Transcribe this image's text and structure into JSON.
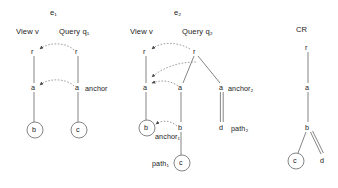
{
  "figure": {
    "panels": [
      {
        "id": "e1",
        "title": "e₁",
        "columns": [
          {
            "heading": "View v"
          },
          {
            "heading": "Query q₁"
          }
        ],
        "nodes": [
          {
            "name": "view-root",
            "label": "r",
            "circled": false,
            "x": 34,
            "y": 52
          },
          {
            "name": "view-a",
            "label": "a",
            "circled": false,
            "x": 34,
            "y": 88
          },
          {
            "name": "view-b",
            "label": "b",
            "circled": true,
            "x": 35,
            "y": 130
          },
          {
            "name": "query-root",
            "label": "r",
            "circled": false,
            "x": 78,
            "y": 52
          },
          {
            "name": "query-a",
            "label": "a",
            "circled": false,
            "x": 78,
            "y": 88
          },
          {
            "name": "query-c",
            "label": "c",
            "circled": true,
            "x": 79,
            "y": 130
          }
        ],
        "annotations": [
          {
            "name": "anchor-label",
            "text": "anchor",
            "x": 85,
            "y": 88
          }
        ]
      },
      {
        "id": "e2",
        "title": "e₂",
        "columns": [
          {
            "heading": "View v"
          },
          {
            "heading": "Query q₂"
          }
        ],
        "nodes": [
          {
            "name": "view-root",
            "label": "r",
            "circled": false,
            "x": 146,
            "y": 52
          },
          {
            "name": "view-a",
            "label": "a",
            "circled": false,
            "x": 146,
            "y": 88
          },
          {
            "name": "view-b",
            "label": "b",
            "circled": true,
            "x": 147,
            "y": 128
          },
          {
            "name": "query-root",
            "label": "r",
            "circled": false,
            "x": 196,
            "y": 52
          },
          {
            "name": "query-a1",
            "label": "a",
            "circled": false,
            "x": 181,
            "y": 88
          },
          {
            "name": "query-b1",
            "label": "b",
            "circled": false,
            "x": 181,
            "y": 128
          },
          {
            "name": "query-c1",
            "label": "c",
            "circled": true,
            "x": 182,
            "y": 163
          },
          {
            "name": "query-a2",
            "label": "a",
            "circled": false,
            "x": 222,
            "y": 88
          },
          {
            "name": "query-d2",
            "label": "d",
            "circled": false,
            "x": 222,
            "y": 128
          }
        ],
        "annotations": [
          {
            "name": "anchor1-label",
            "text": "anchor₁",
            "x": 155,
            "y": 136
          },
          {
            "name": "path1-label",
            "text": "path₁",
            "x": 155,
            "y": 163
          },
          {
            "name": "anchor2-label",
            "text": "anchor₂",
            "x": 229,
            "y": 88
          },
          {
            "name": "path2-label",
            "text": "path₂",
            "x": 232,
            "y": 128
          }
        ]
      },
      {
        "id": "cr",
        "title": "CR",
        "columns": [],
        "nodes": [
          {
            "name": "cr-root",
            "label": "r",
            "circled": false,
            "x": 308,
            "y": 48
          },
          {
            "name": "cr-a",
            "label": "a",
            "circled": false,
            "x": 308,
            "y": 88
          },
          {
            "name": "cr-b",
            "label": "b",
            "circled": false,
            "x": 308,
            "y": 128
          },
          {
            "name": "cr-c",
            "label": "c",
            "circled": true,
            "x": 296,
            "y": 161
          },
          {
            "name": "cr-d",
            "label": "d",
            "circled": false,
            "x": 323,
            "y": 161
          }
        ],
        "annotations": []
      }
    ],
    "colors": {
      "stroke": "#555555",
      "dashed": "#777777",
      "text": "#1a1a1a",
      "background": "#ffffff"
    }
  }
}
